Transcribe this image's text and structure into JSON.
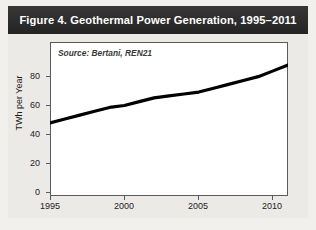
{
  "figure": {
    "title": "Figure 4. Geothermal Power Generation, 1995–2011",
    "source_note": "Source: Bertani, REN21",
    "band_color": "#2b2b2b",
    "title_color": "#ffffff",
    "background_color": "#eceae6",
    "plot_background": "#ffffff",
    "line_color": "#000000"
  },
  "chart_data": {
    "type": "line",
    "title": "Figure 4. Geothermal Power Generation, 1995–2011",
    "xlabel": "",
    "ylabel": "TWh per Year",
    "annotation": "Source: Bertani, REN21",
    "grid": false,
    "legend": "none",
    "xlim": [
      1995,
      2011
    ],
    "ylim": [
      0,
      80
    ],
    "yticks": [
      0,
      20,
      40,
      60,
      80
    ],
    "ytick_labels": [
      "0",
      "20",
      "40",
      "60",
      "80"
    ],
    "xticks": [
      1995,
      2000,
      2005,
      2010
    ],
    "xtick_labels": [
      "1995",
      "2000",
      "2005",
      "2010"
    ],
    "x": [
      1995,
      1996,
      1997,
      1998,
      1999,
      2000,
      2001,
      2002,
      2003,
      2004,
      2005,
      2006,
      2007,
      2008,
      2009,
      2010,
      2011
    ],
    "values": [
      38,
      40,
      42,
      44,
      46,
      47,
      49,
      51,
      52,
      53,
      54,
      56,
      58,
      60,
      62,
      65,
      68
    ],
    "series": [
      {
        "name": "Geothermal power generation",
        "values": [
          38,
          40,
          42,
          44,
          46,
          47,
          49,
          51,
          52,
          53,
          54,
          56,
          58,
          60,
          62,
          65,
          68
        ]
      }
    ]
  }
}
